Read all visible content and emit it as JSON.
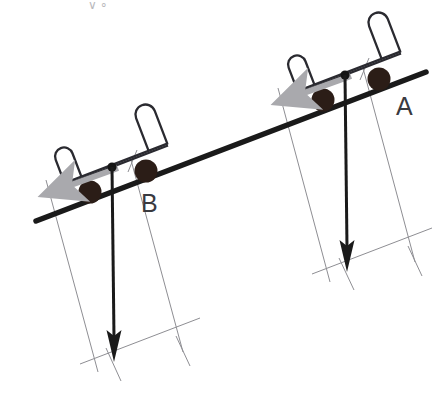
{
  "figure": {
    "kind": "physics-free-body-diagram",
    "background_color": "#ffffff"
  },
  "incline": {
    "name": "inclined-plane",
    "color": "#1a1a1a",
    "stroke_width": 5,
    "x1": 36,
    "y1": 221,
    "x2": 426,
    "y2": 72,
    "angle_degrees": 21
  },
  "carts": [
    {
      "id": "A",
      "label": "A",
      "label_x": 396,
      "label_y": 115,
      "contact_x": 345,
      "contact_y": 75,
      "frame_color": "#2a2a30",
      "wheel_color": "#2b1d17",
      "wheel_radius": 11,
      "wheels": [
        {
          "name": "wheel-rear",
          "cx": 323,
          "cy": 100
        },
        {
          "name": "wheel-front",
          "cx": 378,
          "cy": 79
        }
      ],
      "com_dot": {
        "cx": 345,
        "cy": 75,
        "r": 4.5,
        "color": "#141414"
      },
      "slope_arrow": {
        "name": "downslope-force-arrow",
        "color": "#a9a9ad",
        "x1": 350,
        "y1": 76,
        "x2": 272,
        "y2": 104,
        "stroke_width": 6
      },
      "weight_vector": {
        "name": "weight-vector",
        "color": "#1a1a1a",
        "x1": 345,
        "y1": 75,
        "x2": 348,
        "y2": 268,
        "stroke_width": 3,
        "head_length": 26,
        "head_width": 14
      },
      "component_parallelogram": {
        "color": "#8e8e93",
        "stroke_width": 1,
        "perpendicular": {
          "x1": 278,
          "y1": 88,
          "x2": 330,
          "y2": 285
        },
        "parallel": {
          "x1": 363,
          "y1": 68,
          "x2": 415,
          "y2": 265
        },
        "base": {
          "x1": 318,
          "y1": 275,
          "x2": 428,
          "y2": 233
        },
        "apex_tick": {
          "x1": 360,
          "y1": 78,
          "x2": 368,
          "y2": 60
        }
      }
    },
    {
      "id": "B",
      "label": "B",
      "label_x": 141,
      "label_y": 212,
      "contact_x": 112,
      "contact_y": 167,
      "frame_color": "#2a2a30",
      "wheel_color": "#2b1d17",
      "wheel_radius": 11,
      "wheels": [
        {
          "name": "wheel-rear",
          "cx": 90,
          "cy": 192
        },
        {
          "name": "wheel-front",
          "cx": 146,
          "cy": 171
        },
        {
          "name": "wheel-note",
          "cx": 0,
          "cy": 0
        }
      ],
      "com_dot": {
        "cx": 112,
        "cy": 167,
        "r": 4.5,
        "color": "#141414"
      },
      "slope_arrow": {
        "name": "downslope-force-arrow",
        "color": "#a9a9ad",
        "x1": 117,
        "y1": 168,
        "x2": 40,
        "y2": 196,
        "stroke_width": 6
      },
      "weight_vector": {
        "name": "weight-vector",
        "color": "#1a1a1a",
        "x1": 112,
        "y1": 167,
        "x2": 114,
        "y2": 355,
        "stroke_width": 3,
        "head_length": 26,
        "head_width": 14
      },
      "component_parallelogram": {
        "color": "#8e8e93",
        "stroke_width": 1,
        "perpendicular": {
          "x1": 46,
          "y1": 180,
          "x2": 98,
          "y2": 372
        },
        "parallel": {
          "x1": 131,
          "y1": 160,
          "x2": 183,
          "y2": 352
        },
        "base": {
          "x1": 86,
          "y1": 362,
          "x2": 196,
          "y2": 320
        },
        "apex_tick": {
          "x1": 128,
          "y1": 170,
          "x2": 136,
          "y2": 152
        }
      }
    }
  ],
  "cart_body": {
    "name": "cart-frame-bracket",
    "stroke_width": 2.2,
    "color": "#2a2a30",
    "shape": "open-u-bracket-with-rounded-posts"
  },
  "annotations": {
    "top_faint_mark": "∨ ∘",
    "top_faint_mark_x": 88,
    "top_faint_mark_y": 8
  }
}
